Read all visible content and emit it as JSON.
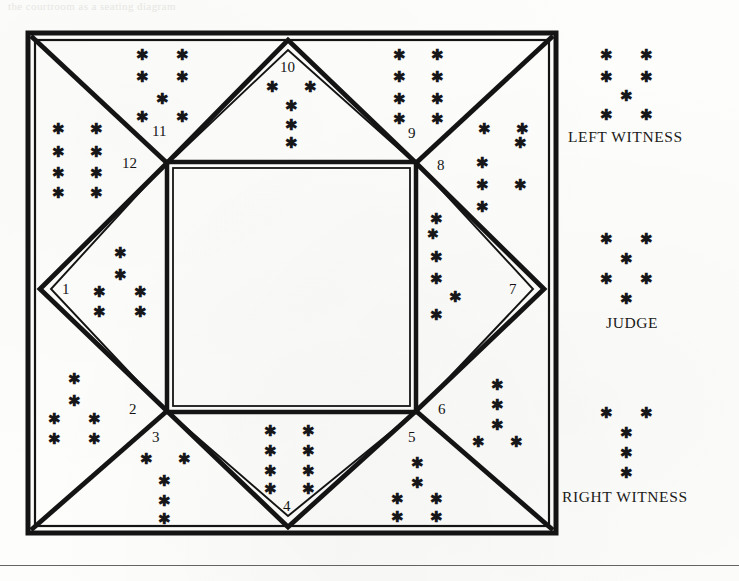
{
  "figure": {
    "title_ghost": "the courtroom as a seating diagram",
    "type": "seating-diagram",
    "outer_square": {
      "x": 28,
      "y": 33,
      "width": 528,
      "height": 500
    },
    "inner_square": {
      "x": 167,
      "y": 162,
      "width": 249,
      "height": 250
    },
    "vertex_count": 12,
    "vertices": [
      {
        "id": 1,
        "label": "1",
        "x": 44,
        "y": 289,
        "anchor": "left-mid"
      },
      {
        "id": 2,
        "label": "2",
        "x": 132,
        "y": 409,
        "anchor": "inner-bottom-left"
      },
      {
        "id": 3,
        "label": "3",
        "x": 157,
        "y": 435,
        "anchor": "inner-bottom-left"
      },
      {
        "id": 4,
        "label": "4",
        "x": 287,
        "y": 506,
        "anchor": "bottom-mid"
      },
      {
        "id": 5,
        "label": "5",
        "x": 413,
        "y": 435,
        "anchor": "inner-bottom-right"
      },
      {
        "id": 6,
        "label": "6",
        "x": 441,
        "y": 409,
        "anchor": "inner-bottom-right"
      },
      {
        "id": 7,
        "label": "7",
        "x": 516,
        "y": 289,
        "anchor": "right-mid"
      },
      {
        "id": 8,
        "label": "8",
        "x": 441,
        "y": 165,
        "anchor": "inner-top-right"
      },
      {
        "id": 9,
        "label": "9",
        "x": 413,
        "y": 133,
        "anchor": "inner-top-right"
      },
      {
        "id": 10,
        "label": "10",
        "x": 288,
        "y": 66,
        "anchor": "top-mid"
      },
      {
        "id": 11,
        "label": "11",
        "x": 160,
        "y": 131,
        "anchor": "inner-top-left"
      },
      {
        "id": 12,
        "label": "12",
        "x": 130,
        "y": 163,
        "anchor": "inner-top-left"
      }
    ]
  },
  "legend": {
    "items": [
      {
        "key": "left_witness",
        "label": "LEFT WITNESS",
        "glyph_count": 5,
        "pattern": "2-2-1-2-partial"
      },
      {
        "key": "judge",
        "label": "JUDGE",
        "glyph_count": 6,
        "pattern": "2-1-2-1"
      },
      {
        "key": "right_witness",
        "label": "RIGHT WITNESS",
        "glyph_count": 5,
        "pattern": "2-1-1-1"
      }
    ],
    "glyph_char": "*"
  },
  "asterisks": {
    "glyph": "*",
    "clusters": [
      {
        "name": "cluster-top-left-outer",
        "count": 8,
        "region": "top-left-triangle"
      },
      {
        "name": "cluster-left-upper",
        "count": 8,
        "region": "left-upper-band"
      },
      {
        "name": "cluster-left-mid",
        "count": 6,
        "region": "vertex-1-right"
      },
      {
        "name": "cluster-left-lower",
        "count": 6,
        "region": "left-lower-band"
      },
      {
        "name": "cluster-bottom-left",
        "count": 5,
        "region": "vertex-3-below"
      },
      {
        "name": "cluster-bottom-mid",
        "count": 8,
        "region": "vertex-4-left"
      },
      {
        "name": "cluster-bottom-right",
        "count": 6,
        "region": "vertex-5-below"
      },
      {
        "name": "cluster-right-lower",
        "count": 5,
        "region": "vertex-6-right"
      },
      {
        "name": "cluster-right-mid",
        "count": 6,
        "region": "vertex-7-left"
      },
      {
        "name": "cluster-right-upper",
        "count": 5,
        "region": "vertex-8-right"
      },
      {
        "name": "cluster-top-right-outer",
        "count": 8,
        "region": "top-right-triangle"
      },
      {
        "name": "cluster-top-mid",
        "count": 5,
        "region": "vertex-10-below"
      }
    ]
  },
  "colors": {
    "ink": "#141414",
    "paper": "#fdfdfb",
    "rule": "#4a4a48"
  }
}
